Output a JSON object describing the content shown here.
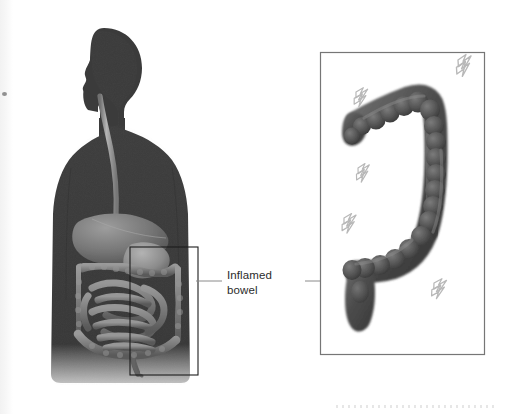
{
  "figure": {
    "background_color": "#ffffff",
    "width": 507,
    "height": 414
  },
  "callout": {
    "label_text": "Inflamed\nbowel",
    "label_line1": "Inflamed",
    "label_line2": "bowel",
    "text_color": "#2b2b2b",
    "leader_line_color": "#8a8a8a",
    "left_leader": {
      "x1": 196,
      "y1": 281,
      "x2": 222,
      "y2": 281
    },
    "right_leader": {
      "x1": 305,
      "y1": 281,
      "x2": 372,
      "y2": 281
    }
  },
  "body_figure": {
    "name": "human-torso-silhouette",
    "silhouette_color": "#3a3a3a",
    "description": "Dark side-facing head and torso silhouette with visible digestive tract",
    "organs": [
      {
        "name": "esophagus",
        "color": "#9a9a9a"
      },
      {
        "name": "liver",
        "color": "#707070"
      },
      {
        "name": "stomach",
        "color": "#8c8c8c"
      },
      {
        "name": "transverse-colon",
        "color": "#8a8a8a"
      },
      {
        "name": "small-intestine",
        "color": "#7e7e7e"
      },
      {
        "name": "ascending-colon",
        "color": "#848484"
      },
      {
        "name": "descending-colon",
        "color": "#848484"
      },
      {
        "name": "sigmoid-colon",
        "color": "#6a6a6a"
      }
    ]
  },
  "selection_rect": {
    "name": "abdomen-zoom-region",
    "x": 130,
    "y": 247,
    "width": 68,
    "height": 128,
    "border_color": "#1c1c1c"
  },
  "inset_panel": {
    "name": "inflamed-bowel-detail",
    "x": 320,
    "y": 52,
    "width": 165,
    "height": 303,
    "border_color": "#767676",
    "background_color": "#ffffff",
    "organ": {
      "name": "large-intestine-colon",
      "color": "#4a4a4a",
      "highlight_color": "#6f6f6f",
      "segments": [
        "transverse colon",
        "hepatic flexure",
        "descending colon",
        "sigmoid colon",
        "rectum"
      ]
    },
    "pain_symbols": {
      "name": "lightning-bolt-icon",
      "count": 5,
      "color": "#b8b8b8",
      "positions": [
        {
          "x": 458,
          "y": 60,
          "rotation": -22,
          "scale": 1.05
        },
        {
          "x": 356,
          "y": 92,
          "rotation": -18,
          "scale": 0.92
        },
        {
          "x": 358,
          "y": 168,
          "rotation": -20,
          "scale": 0.9
        },
        {
          "x": 344,
          "y": 218,
          "rotation": -18,
          "scale": 0.95
        },
        {
          "x": 434,
          "y": 283,
          "rotation": -16,
          "scale": 0.98
        }
      ]
    }
  },
  "artifacts": {
    "left_scan_strip_color": "#f2f2f2",
    "speck_color": "#6e6e6e",
    "bottom_dots_color": "#e2e2e2"
  }
}
